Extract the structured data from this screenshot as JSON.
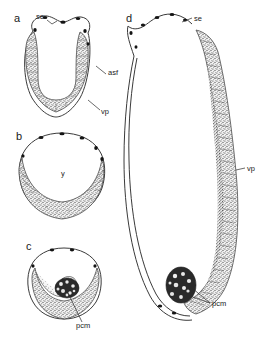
{
  "figure": {
    "background_color": "#ffffff",
    "ink_color": "#2a2a2a"
  },
  "panels": [
    {
      "id": "a",
      "letter": "a",
      "letter_x": 14,
      "letter_y": 22,
      "description": "U-shaped stippled germ band within thin outer egg envelope",
      "annotations": [
        {
          "name": "se",
          "label": "se",
          "label_x": 36,
          "label_y": 19
        },
        {
          "name": "asf",
          "label": "asf",
          "label_x": 108,
          "label_y": 75
        },
        {
          "name": "vp",
          "label": "vp",
          "label_x": 101,
          "label_y": 114
        }
      ]
    },
    {
      "id": "b",
      "letter": "b",
      "letter_x": 16,
      "letter_y": 140,
      "description": "Circular section with thick stippled ventral band and open yolk centre",
      "annotations": [
        {
          "name": "y",
          "label": "y",
          "label_x": 61,
          "label_y": 176
        }
      ]
    },
    {
      "id": "c",
      "letter": "c",
      "letter_x": 26,
      "letter_y": 250,
      "description": "Circular section with crescentic stippled band and dense pole cell mass",
      "annotations": [
        {
          "name": "pcm",
          "label": "pcm",
          "label_x": 76,
          "label_y": 328
        }
      ]
    },
    {
      "id": "d",
      "letter": "d",
      "letter_x": 126,
      "letter_y": 22,
      "description": "Elongate embryo, thin outer envelope at left and long stippled germ band at right with pole cell mass at base",
      "annotations": [
        {
          "name": "se",
          "label": "se",
          "label_x": 194,
          "label_y": 21
        },
        {
          "name": "vp",
          "label": "vp",
          "label_x": 247,
          "label_y": 171
        },
        {
          "name": "pcm",
          "label": "pcm",
          "label_x": 212,
          "label_y": 306
        }
      ]
    }
  ],
  "legend_keys": [
    {
      "abbr": "se",
      "meaning": "serosa"
    },
    {
      "abbr": "asf",
      "meaning": "amniotic/serosal fold"
    },
    {
      "abbr": "vp",
      "meaning": "ventral plate"
    },
    {
      "abbr": "y",
      "meaning": "yolk"
    },
    {
      "abbr": "pcm",
      "meaning": "pole cell mass"
    }
  ]
}
